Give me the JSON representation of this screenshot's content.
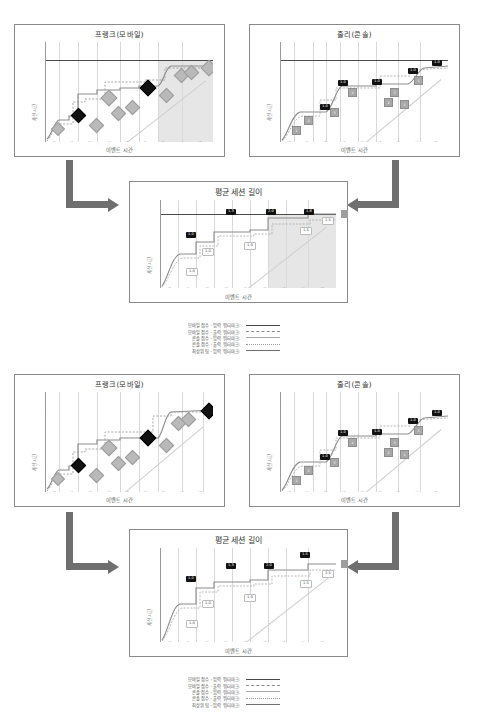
{
  "page": {
    "background": "#ffffff",
    "accent": "#6f6f6f"
  },
  "charts": {
    "top_left": {
      "title": "프랭크(모바일)",
      "xlabel": "이벤트 시간",
      "ylabel": "세션 시간"
    },
    "top_right": {
      "title": "줄리(콘솔)",
      "xlabel": "이벤트 시간",
      "ylabel": "세션 시간"
    },
    "top_mid": {
      "title": "평균 세션 길이",
      "xlabel": "이벤트 시간",
      "ylabel": "세션 시간"
    },
    "bot_left": {
      "title": "프랭크(모바일)",
      "xlabel": "이벤트 시간",
      "ylabel": "세션 시간"
    },
    "bot_right": {
      "title": "줄리(콘솔)",
      "xlabel": "이벤트 시간",
      "ylabel": "세션 시간"
    },
    "bot_mid": {
      "title": "평균 세션 길이",
      "xlabel": "이벤트 시간",
      "ylabel": "세션 시간"
    }
  },
  "legend": {
    "rows": [
      {
        "label": "모바일 점수 - 입력 워터마크:",
        "style": "s1"
      },
      {
        "label": "모바일 점수 - 출력 워터마크:",
        "style": "s2"
      },
      {
        "label": "콘솔 점수 - 입력 워터마크:",
        "style": "s3"
      },
      {
        "label": "콘솔 점수 - 출력 워터마크:",
        "style": "s4"
      },
      {
        "label": "최상위 팀 - 입력 워터마크:",
        "style": "s5"
      }
    ]
  },
  "chart_data": [
    {
      "id": "top_left",
      "type": "line",
      "title": "프랭크(모바일)",
      "xlabel": "이벤트 시간",
      "ylabel": "세션 시간",
      "xticks": [
        "12:00",
        "12:01",
        "12:02",
        "12:03",
        "12:04",
        "12:05",
        "12:06",
        "12:07",
        "12:08",
        "12:09"
      ],
      "yticks": [
        "12:00",
        "12:02",
        "12:04",
        "12:06",
        "12:08",
        "12:10"
      ],
      "grid": true,
      "legend_position": "below-figure",
      "shaded_region": {
        "x_from": "12:06",
        "x_to": "12:09",
        "color": "#d2d2d2"
      },
      "cap_line_y": "12:09",
      "series": [
        {
          "name": "모바일 점수 - 입력 워터마크",
          "points_x": [
            "12:00",
            "12:01",
            "12:02",
            "12:03",
            "12:05",
            "12:06",
            "12:07",
            "12:09"
          ],
          "points_y": [
            0.05,
            0.22,
            0.25,
            0.52,
            0.55,
            0.56,
            0.9,
            0.92
          ]
        },
        {
          "name": "모바일 점수 - 출력 워터마크",
          "points_x": [
            "12:00",
            "12:01",
            "12:02",
            "12:03",
            "12:05",
            "12:06",
            "12:07",
            "12:09"
          ],
          "points_y": [
            0.02,
            0.18,
            0.2,
            0.46,
            0.5,
            0.5,
            0.84,
            0.86
          ]
        }
      ],
      "event_markers": [
        {
          "x": "12:00",
          "y": 0.1,
          "kind": "diamond-gray"
        },
        {
          "x": "12:01",
          "y": 0.24,
          "kind": "diamond-dark"
        },
        {
          "x": "12:02",
          "y": 0.18,
          "kind": "diamond-gray"
        },
        {
          "x": "12:02",
          "y": 0.42,
          "kind": "diamond-gray"
        },
        {
          "x": "12:03",
          "y": 0.3,
          "kind": "diamond-gray"
        },
        {
          "x": "12:04",
          "y": 0.35,
          "kind": "diamond-gray"
        },
        {
          "x": "12:05",
          "y": 0.56,
          "kind": "diamond-dark"
        },
        {
          "x": "12:06",
          "y": 0.5,
          "kind": "diamond-gray"
        },
        {
          "x": "12:07",
          "y": 0.8,
          "kind": "diamond-gray"
        },
        {
          "x": "12:08",
          "y": 0.84,
          "kind": "diamond-gray"
        },
        {
          "x": "12:09",
          "y": 0.9,
          "kind": "diamond-gray"
        }
      ]
    },
    {
      "id": "top_right",
      "type": "line",
      "title": "줄리(콘솔)",
      "xlabel": "이벤트 시간",
      "ylabel": "세션 시간",
      "xticks": [
        "12:00",
        "12:01",
        "12:02",
        "12:03",
        "12:04",
        "12:05",
        "12:06",
        "12:07",
        "12:08",
        "12:09"
      ],
      "yticks": [
        "12:00",
        "12:02",
        "12:04",
        "12:06",
        "12:08",
        "12:10"
      ],
      "grid": true,
      "cap_line_y": "12:09",
      "series": [
        {
          "name": "콘솔 점수 - 입력 워터마크",
          "points_x": [
            "12:00",
            "12:02",
            "12:03",
            "12:05",
            "12:08",
            "12:09"
          ],
          "points_y": [
            0.15,
            0.4,
            0.62,
            0.64,
            0.8,
            0.9
          ]
        },
        {
          "name": "콘솔 점수 - 출력 워터마크",
          "points_x": [
            "12:00",
            "12:02",
            "12:03",
            "12:05",
            "12:08",
            "12:09"
          ],
          "points_y": [
            0.1,
            0.34,
            0.56,
            0.58,
            0.74,
            0.84
          ]
        }
      ],
      "value_labels": [
        {
          "x": "12:02",
          "y": 0.4,
          "text": "1.0"
        },
        {
          "x": "12:03",
          "y": 0.64,
          "text": "1.0"
        },
        {
          "x": "12:05",
          "y": 0.64,
          "text": "1.0"
        },
        {
          "x": "12:08",
          "y": 0.8,
          "text": "1.0"
        },
        {
          "x": "12:09",
          "y": 0.92,
          "text": "1.0"
        }
      ],
      "count_boxes": [
        {
          "x": "12:00",
          "y": 0.08,
          "text": "1"
        },
        {
          "x": "12:01",
          "y": 0.22,
          "text": "2"
        },
        {
          "x": "12:02",
          "y": 0.34,
          "text": "3"
        },
        {
          "x": "12:03",
          "y": 0.56,
          "text": "4"
        },
        {
          "x": "12:05",
          "y": 0.3,
          "text": "2"
        },
        {
          "x": "12:06",
          "y": 0.38,
          "text": "3"
        },
        {
          "x": "12:06",
          "y": 0.26,
          "text": "1"
        },
        {
          "x": "12:08",
          "y": 0.74,
          "text": "5"
        }
      ]
    },
    {
      "id": "top_mid",
      "type": "line",
      "title": "평균 세션 길이",
      "xlabel": "이벤트 시간",
      "ylabel": "세션 시간",
      "xticks": [
        "12:00",
        "12:01",
        "12:02",
        "12:03",
        "12:04",
        "12:05",
        "12:06",
        "12:07",
        "12:08",
        "12:09"
      ],
      "yticks": [
        "12:00",
        "12:02",
        "12:04",
        "12:06",
        "12:08",
        "12:10"
      ],
      "grid": true,
      "shaded_region": {
        "x_from": "12:06",
        "x_to": "12:09",
        "color": "#d2d2d2"
      },
      "cap_line_y": "12:08",
      "value_labels": [
        {
          "x": "12:01",
          "y": 0.52,
          "text": "1.0"
        },
        {
          "x": "12:04",
          "y": 0.85,
          "text": "1.3"
        },
        {
          "x": "12:06",
          "y": 0.85,
          "text": "2.0"
        },
        {
          "x": "12:08",
          "y": 0.85,
          "text": "1.8"
        },
        {
          "x": "12:09",
          "y": 0.78,
          "text": "1.5",
          "style": "outline"
        },
        {
          "x": "12:08",
          "y": 0.66,
          "text": "1.5",
          "style": "outline"
        },
        {
          "x": "12:02",
          "y": 0.33,
          "text": "1.0",
          "style": "outline"
        },
        {
          "x": "12:01",
          "y": 0.14,
          "text": "1.0",
          "style": "outline"
        },
        {
          "x": "12:05",
          "y": 0.42,
          "text": "1.0",
          "style": "outline"
        }
      ]
    },
    {
      "id": "bot_left",
      "type": "line",
      "title": "프랭크(모바일)",
      "xlabel": "이벤트 시간",
      "ylabel": "세션 시간",
      "xticks": [
        "12:00",
        "12:01",
        "12:02",
        "12:03",
        "12:04",
        "12:05",
        "12:06",
        "12:07",
        "12:08",
        "12:09"
      ],
      "yticks": [
        "12:00",
        "12:02",
        "12:04",
        "12:06",
        "12:08",
        "12:10"
      ],
      "grid": true,
      "shaded_region": null,
      "series": [
        {
          "name": "모바일 점수 - 입력 워터마크",
          "points_x": [
            "12:00",
            "12:01",
            "12:02",
            "12:03",
            "12:05",
            "12:07",
            "12:09"
          ],
          "points_y": [
            0.05,
            0.22,
            0.25,
            0.52,
            0.55,
            0.88,
            0.92
          ]
        },
        {
          "name": "모바일 점수 - 출력 워터마크",
          "points_x": [
            "12:00",
            "12:01",
            "12:02",
            "12:03",
            "12:05",
            "12:07",
            "12:09"
          ],
          "points_y": [
            0.02,
            0.18,
            0.2,
            0.46,
            0.5,
            0.82,
            0.86
          ]
        }
      ],
      "event_markers": [
        {
          "x": "12:00",
          "y": 0.1,
          "kind": "diamond-gray"
        },
        {
          "x": "12:01",
          "y": 0.26,
          "kind": "diamond-dark"
        },
        {
          "x": "12:02",
          "y": 0.18,
          "kind": "diamond-gray"
        },
        {
          "x": "12:02",
          "y": 0.46,
          "kind": "diamond-gray"
        },
        {
          "x": "12:03",
          "y": 0.32,
          "kind": "diamond-gray"
        },
        {
          "x": "12:04",
          "y": 0.38,
          "kind": "diamond-gray"
        },
        {
          "x": "12:05",
          "y": 0.58,
          "kind": "diamond-dark"
        },
        {
          "x": "12:06",
          "y": 0.5,
          "kind": "diamond-gray"
        },
        {
          "x": "12:07",
          "y": 0.78,
          "kind": "diamond-gray"
        },
        {
          "x": "12:08",
          "y": 0.84,
          "kind": "diamond-gray"
        },
        {
          "x": "12:09",
          "y": 0.92,
          "kind": "diamond-dark"
        }
      ]
    },
    {
      "id": "bot_right",
      "type": "line",
      "title": "줄리(콘솔)",
      "xlabel": "이벤트 시간",
      "ylabel": "세션 시간",
      "xticks": [
        "12:00",
        "12:01",
        "12:02",
        "12:03",
        "12:04",
        "12:05",
        "12:06",
        "12:07",
        "12:08",
        "12:09"
      ],
      "yticks": [
        "12:00",
        "12:02",
        "12:04",
        "12:06",
        "12:08",
        "12:10"
      ],
      "grid": true,
      "value_labels": [
        {
          "x": "12:02",
          "y": 0.4,
          "text": "1.0"
        },
        {
          "x": "12:03",
          "y": 0.64,
          "text": "1.0"
        },
        {
          "x": "12:05",
          "y": 0.64,
          "text": "1.0"
        },
        {
          "x": "12:08",
          "y": 0.8,
          "text": "1.0"
        },
        {
          "x": "12:09",
          "y": 0.9,
          "text": "1.0"
        }
      ],
      "count_boxes": [
        {
          "x": "12:00",
          "y": 0.08,
          "text": "1"
        },
        {
          "x": "12:01",
          "y": 0.22,
          "text": "2"
        },
        {
          "x": "12:02",
          "y": 0.34,
          "text": "3"
        },
        {
          "x": "12:03",
          "y": 0.56,
          "text": "4"
        },
        {
          "x": "12:05",
          "y": 0.3,
          "text": "2"
        },
        {
          "x": "12:06",
          "y": 0.38,
          "text": "3"
        },
        {
          "x": "12:06",
          "y": 0.26,
          "text": "1"
        },
        {
          "x": "12:08",
          "y": 0.74,
          "text": "5"
        }
      ]
    },
    {
      "id": "bot_mid",
      "type": "line",
      "title": "평균 세션 길이",
      "xlabel": "이벤트 시간",
      "ylabel": "세션 시간",
      "xticks": [
        "12:00",
        "12:01",
        "12:02",
        "12:03",
        "12:04",
        "12:05",
        "12:06",
        "12:07",
        "12:08",
        "12:09"
      ],
      "yticks": [
        "12:00",
        "12:02",
        "12:04",
        "12:06",
        "12:08",
        "12:10"
      ],
      "grid": true,
      "shaded_region": null,
      "value_labels": [
        {
          "x": "12:01",
          "y": 0.58,
          "text": "1.0"
        },
        {
          "x": "12:03",
          "y": 0.82,
          "text": "1.3"
        },
        {
          "x": "12:05",
          "y": 0.82,
          "text": "2.0"
        },
        {
          "x": "12:07",
          "y": 0.92,
          "text": "1.5"
        },
        {
          "x": "12:09",
          "y": 0.72,
          "text": "1.5",
          "style": "outline"
        },
        {
          "x": "12:08",
          "y": 0.62,
          "text": "1.5",
          "style": "outline"
        },
        {
          "x": "12:02",
          "y": 0.33,
          "text": "1.0",
          "style": "outline"
        },
        {
          "x": "12:01",
          "y": 0.14,
          "text": "1.0",
          "style": "outline"
        },
        {
          "x": "12:05",
          "y": 0.42,
          "text": "1.0",
          "style": "outline"
        }
      ]
    }
  ]
}
